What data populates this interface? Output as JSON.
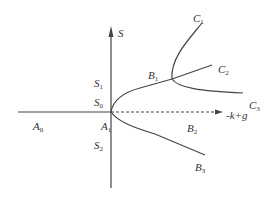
{
  "diagram": {
    "type": "bifurcation-diagram",
    "colors": {
      "stroke": "#444444",
      "text": "#333333",
      "background": "#ffffff"
    },
    "axes": {
      "vertical": {
        "label": "S"
      },
      "horizontal": {
        "label": "-k+g",
        "style": "dashed-arrow"
      }
    },
    "labels": {
      "S": "S",
      "S1": {
        "base": "S",
        "sub": "1"
      },
      "S0": {
        "base": "S",
        "sub": "0"
      },
      "S2": {
        "base": "S",
        "sub": "2"
      },
      "A0": {
        "base": "A",
        "sub": "0"
      },
      "A1": {
        "base": "A",
        "sub": "1"
      },
      "B1": {
        "base": "B",
        "sub": "1"
      },
      "B2": {
        "base": "B",
        "sub": "2"
      },
      "B3": {
        "base": "B",
        "sub": "3"
      },
      "C1": {
        "base": "C",
        "sub": "1"
      },
      "C2": {
        "base": "C",
        "sub": "2"
      },
      "C3": {
        "base": "C",
        "sub": "3"
      },
      "axis_x": "-k+g"
    },
    "branches": [
      {
        "name": "A0",
        "description": "solid line from left to A1"
      },
      {
        "name": "B1",
        "description": "upper branch from A1 to junction"
      },
      {
        "name": "B2",
        "description": "dashed branch along horizontal axis"
      },
      {
        "name": "B3",
        "description": "lower branch from A1"
      },
      {
        "name": "C1",
        "description": "upper curve after junction"
      },
      {
        "name": "C2",
        "description": "straight continuation after junction"
      },
      {
        "name": "C3",
        "description": "lower curve after junction"
      }
    ]
  }
}
